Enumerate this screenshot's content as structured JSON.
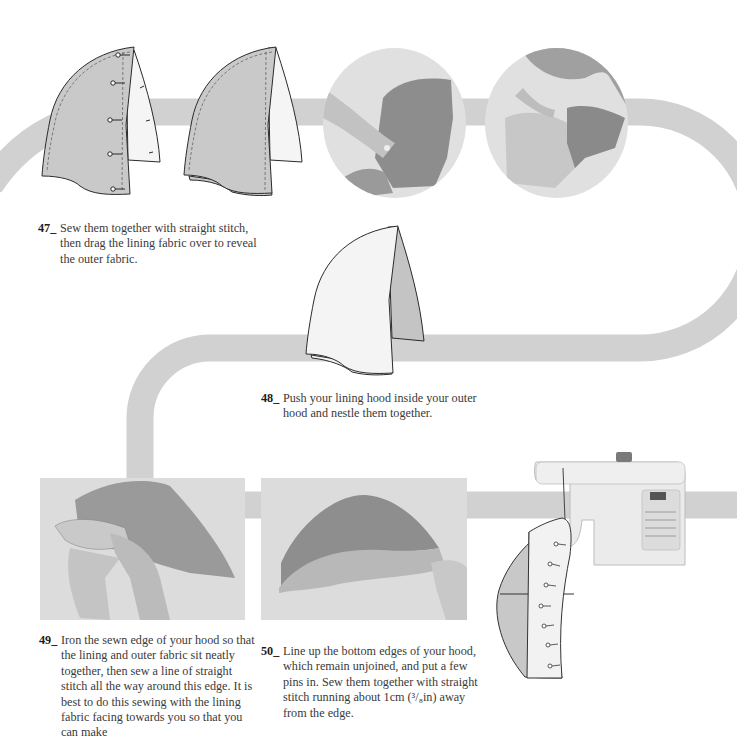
{
  "colors": {
    "ribbon": "#cfcfcf",
    "outer_fabric": "#c9c9c9",
    "lining_fabric": "#f4f4f4",
    "outline": "#2b2b2b",
    "photo_bg": "#dedede",
    "fabric_dark": "#8e8e8e",
    "fabric_mid": "#b5b5b5",
    "skin": "#d2d2d2"
  },
  "steps": [
    {
      "number": "47_",
      "text": "Sew them together with straight stitch, then drag the lining fabric over to reveal the outer fabric.",
      "figures": [
        "pinned-hood-diagram",
        "sewn-hood-diagram",
        "photo-turning-hood",
        "photo-dragging-lining"
      ]
    },
    {
      "number": "48_",
      "text": "Push your lining hood inside your outer hood and nestle them together.",
      "figures": [
        "nested-hood-diagram"
      ]
    },
    {
      "number": "49_",
      "text": "Iron the sewn edge of your hood so that the lining and outer fabric sit neatly together, then sew a line of straight stitch all the way around this edge. It is best to do this sewing with the lining fabric facing towards you so that you can make",
      "figures": [
        "photo-ironing-hood"
      ]
    },
    {
      "number": "50_",
      "text": "Line up the bottom edges of your hood, which remain unjoined, and put a few pins in. Sew them together with straight stitch running about 1cm (³/₈in) away from the edge.",
      "figures": [
        "photo-pinning-hood",
        "sewing-machine-diagram"
      ]
    }
  ]
}
